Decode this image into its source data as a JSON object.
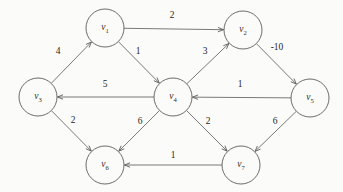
{
  "figure": {
    "type": "directed-weighted-graph",
    "background_color": "#fbfbf9",
    "stroke_color": "#5b5b5b",
    "text_color": "#1f1f1f",
    "width": 343,
    "height": 192
  },
  "chart_data": {
    "type": "diagram",
    "title": "",
    "nodes": [
      {
        "id": "v1",
        "base": "v",
        "sub": "1",
        "x": 105,
        "y": 28,
        "r": 19
      },
      {
        "id": "v2",
        "base": "v",
        "sub": "2",
        "x": 243,
        "y": 30,
        "r": 19
      },
      {
        "id": "v3",
        "base": "v",
        "sub": "3",
        "x": 38,
        "y": 97,
        "r": 19
      },
      {
        "id": "v4",
        "base": "v",
        "sub": "4",
        "x": 173,
        "y": 97,
        "r": 19
      },
      {
        "id": "v5",
        "base": "v",
        "sub": "5",
        "x": 310,
        "y": 98,
        "r": 19
      },
      {
        "id": "v6",
        "base": "v",
        "sub": "6",
        "x": 105,
        "y": 165,
        "r": 19
      },
      {
        "id": "v7",
        "base": "v",
        "sub": "7",
        "x": 241,
        "y": 165,
        "r": 19
      }
    ],
    "edges": [
      {
        "from": "v1",
        "to": "v2",
        "weight": "2",
        "label_x": 172,
        "label_y": 16
      },
      {
        "from": "v3",
        "to": "v1",
        "weight": "4",
        "label_x": 58,
        "label_y": 52
      },
      {
        "from": "v1",
        "to": "v4",
        "weight": "1",
        "label_x": 138,
        "label_y": 52
      },
      {
        "from": "v4",
        "to": "v2",
        "weight": "3",
        "label_x": 205,
        "label_y": 52
      },
      {
        "from": "v2",
        "to": "v5",
        "weight": "-10",
        "label_x": 277,
        "label_y": 48
      },
      {
        "from": "v4",
        "to": "v3",
        "weight": "5",
        "label_x": 105,
        "label_y": 85
      },
      {
        "from": "v5",
        "to": "v4",
        "weight": "1",
        "label_x": 240,
        "label_y": 85
      },
      {
        "from": "v3",
        "to": "v6",
        "weight": "2",
        "label_x": 73,
        "label_y": 121
      },
      {
        "from": "v4",
        "to": "v6",
        "weight": "6",
        "label_x": 140,
        "label_y": 122
      },
      {
        "from": "v4",
        "to": "v7",
        "weight": "2",
        "label_x": 208,
        "label_y": 122
      },
      {
        "from": "v5",
        "to": "v7",
        "weight": "6",
        "label_x": 275,
        "label_y": 122
      },
      {
        "from": "v7",
        "to": "v6",
        "weight": "1",
        "label_x": 173,
        "label_y": 156
      }
    ],
    "xlabel": "",
    "ylabel": "",
    "legend": [],
    "grid": false
  }
}
